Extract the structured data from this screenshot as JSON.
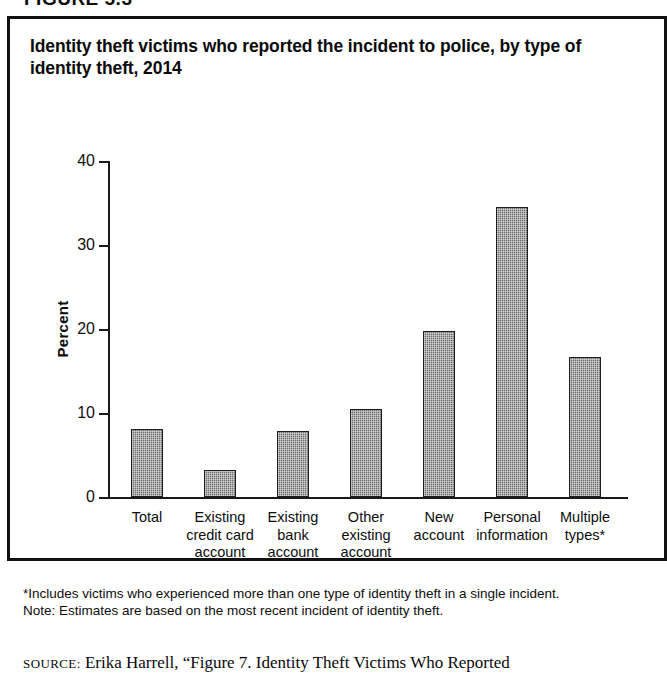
{
  "figure": {
    "header_clipped": "FIGURE 5.3",
    "title": "Identity theft victims who reported the incident to police, by type of identity theft, 2014"
  },
  "notes": {
    "footnote": "*Includes victims who experienced more than one type of identity theft in a single incident.",
    "note": "Note: Estimates are based on the most recent incident of identity theft.",
    "source_label": "SOURCE:",
    "source_text": "Erika Harrell, “Figure 7. Identity Theft Victims Who Reported"
  },
  "chart_data": {
    "type": "bar",
    "title": "Identity theft victims who reported the incident to police, by type of identity theft, 2014",
    "xlabel": "",
    "ylabel": "Percent",
    "ylim": [
      0,
      40
    ],
    "yticks": [
      "0",
      "10",
      "20",
      "30",
      "40"
    ],
    "grid": false,
    "legend": null,
    "categories": [
      "Total",
      "Existing credit card account",
      "Existing bank account",
      "Other existing account",
      "New account",
      "Personal information",
      "Multiple types*"
    ],
    "category_lines": [
      [
        "Total"
      ],
      [
        "Existing",
        "credit card",
        "account"
      ],
      [
        "Existing",
        "bank",
        "account"
      ],
      [
        "Other",
        "existing",
        "account"
      ],
      [
        "New",
        "account"
      ],
      [
        "Personal",
        "information"
      ],
      [
        "Multiple",
        "types*"
      ]
    ],
    "values": [
      8.1,
      3.2,
      7.8,
      10.5,
      19.8,
      34.5,
      16.7
    ],
    "bar_color": "#6f6f6f",
    "bar_edge_color": "#1d1d1d"
  }
}
